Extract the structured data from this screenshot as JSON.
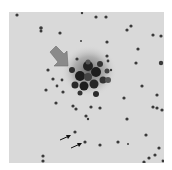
{
  "image": {
    "description": "Grayscale astronomical star field with a globular cluster indicated by a large gray arrow; two small black arrows mark faint stars below.",
    "background_color": "#d9d9d9",
    "star_color": "#3a3a3a",
    "cluster_color": "#1e1e1e",
    "pointer_arrow_color": "#8a8a8a",
    "marker_arrow_color": "#111111"
  },
  "annotations": [
    {
      "type": "large-gray-arrow",
      "points_to": "cluster"
    },
    {
      "type": "small-black-arrow",
      "points_to": "faint-star-1"
    },
    {
      "type": "small-black-arrow",
      "points_to": "faint-star-2"
    }
  ]
}
